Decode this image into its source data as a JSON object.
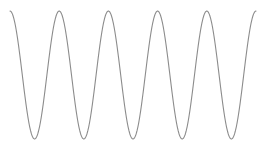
{
  "chart_data": {
    "type": "line",
    "title": "",
    "xlabel": "",
    "ylabel": "",
    "grid": false,
    "legend": null,
    "series": [
      {
        "name": "cosine wave",
        "function": "cos",
        "periods": 5,
        "amplitude": 1,
        "color": "#8c8c8c"
      }
    ],
    "xlim": [
      0,
      10
    ],
    "ylim": [
      -1,
      1
    ],
    "plot_area_px": {
      "x0": 10,
      "x1": 256,
      "y_top": 11,
      "y_bottom": 139
    },
    "line_color": "#8c8c8c",
    "line_width": 1.1
  }
}
